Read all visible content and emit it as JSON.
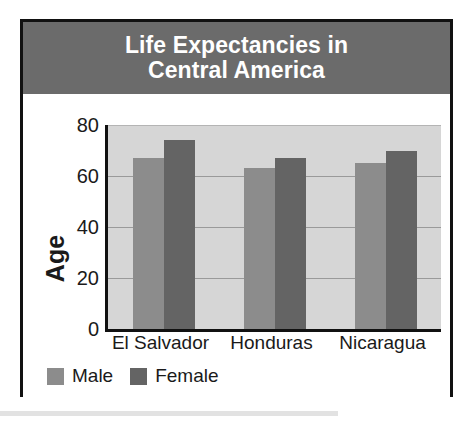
{
  "chart_data": {
    "type": "bar",
    "title": "Life Expectancies in Central America",
    "title_line1": "Life Expectancies in",
    "title_line2": "Central America",
    "xlabel": "",
    "ylabel": "Age",
    "categories": [
      "El Salvador",
      "Honduras",
      "Nicaragua"
    ],
    "series": [
      {
        "name": "Male",
        "values": [
          67,
          63,
          65
        ],
        "color": "#8c8c8c"
      },
      {
        "name": "Female",
        "values": [
          74,
          67,
          70
        ],
        "color": "#646464"
      }
    ],
    "ylim": [
      0,
      80
    ],
    "yticks": [
      80,
      60,
      40,
      20,
      0
    ],
    "ytick_labels": [
      "80",
      "60",
      "40",
      "20",
      "0"
    ],
    "grid": true,
    "gridlines_at": [
      80,
      60,
      40,
      20
    ],
    "legend_position": "bottom-left",
    "legend_entries": [
      "Male",
      "Female"
    ]
  },
  "style": {
    "banner_color": "#6b6b6b",
    "title_color": "#ffffff",
    "plot_background": "#d6d6d6",
    "axis_color": "#111111",
    "gridline_color": "#9a9a9a",
    "border_color": "#111111"
  }
}
